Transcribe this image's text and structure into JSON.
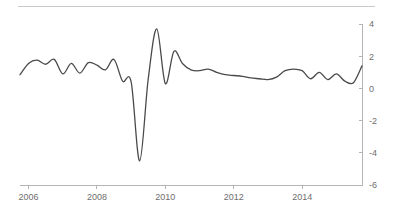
{
  "chart_data": {
    "type": "line",
    "title": "",
    "subtitle": "",
    "xlabel": "",
    "ylabel": "",
    "grid": false,
    "legend": null,
    "xlim": [
      2005.75,
      2015.75
    ],
    "ylim": [
      -6,
      4
    ],
    "y_ticks": [
      4,
      2,
      0,
      -2,
      -4,
      -6
    ],
    "y_tick_labels": [
      "4",
      "2",
      "0",
      "-2",
      "-4",
      "-6"
    ],
    "y_axis_position": "right",
    "x_ticks": [
      2006,
      2008,
      2010,
      2012,
      2014
    ],
    "x_tick_labels": [
      "2006",
      "2008",
      "2010",
      "2012",
      "2014"
    ],
    "line_color": "#4a4a4a",
    "axis_color": "#b5b5b5",
    "tick_label_color": "#6e6e6e",
    "background_color": "#ffffff",
    "series": [
      {
        "name": "series-1",
        "x": [
          2005.75,
          2006.0,
          2006.25,
          2006.5,
          2006.75,
          2007.0,
          2007.25,
          2007.5,
          2007.75,
          2008.0,
          2008.25,
          2008.5,
          2008.75,
          2009.0,
          2009.25,
          2009.5,
          2009.75,
          2010.0,
          2010.25,
          2010.5,
          2010.75,
          2011.0,
          2011.25,
          2011.5,
          2011.75,
          2012.0,
          2012.25,
          2012.5,
          2012.75,
          2013.0,
          2013.25,
          2013.5,
          2013.75,
          2014.0,
          2014.25,
          2014.5,
          2014.75,
          2015.0,
          2015.25,
          2015.5,
          2015.75
        ],
        "y": [
          0.85,
          1.55,
          1.75,
          1.5,
          1.8,
          0.9,
          1.55,
          0.95,
          1.6,
          1.45,
          1.15,
          1.8,
          0.45,
          0.4,
          -4.5,
          0.6,
          3.7,
          0.3,
          2.3,
          1.55,
          1.15,
          1.1,
          1.2,
          1.0,
          0.85,
          0.8,
          0.75,
          0.65,
          0.6,
          0.55,
          0.7,
          1.1,
          1.2,
          1.1,
          0.6,
          1.0,
          0.55,
          0.9,
          0.45,
          0.35,
          1.4
        ]
      }
    ],
    "annotations": []
  }
}
